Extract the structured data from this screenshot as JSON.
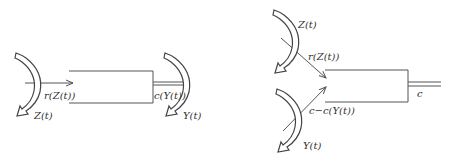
{
  "colors": {
    "stroke": "#555555",
    "text": "#333333",
    "background": "#ffffff"
  },
  "left_diagram": {
    "input_rotation_label": "Z(t)",
    "input_flow_label": "r(Z(t))",
    "output_flow_label": "c(Y(t))",
    "output_rotation_label": "Y(t)"
  },
  "right_diagram": {
    "top_rotation_label": "Z(t)",
    "top_flow_label": "r(Z(t))",
    "bottom_flow_label": "c−c(Y(t))",
    "bottom_rotation_label": "Y(t)",
    "output_label": "c"
  }
}
